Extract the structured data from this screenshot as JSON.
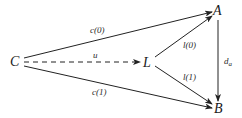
{
  "diagram": {
    "nodes": {
      "C": {
        "label": "C"
      },
      "L": {
        "label": "L"
      },
      "A": {
        "label": "A"
      },
      "B": {
        "label": "B"
      }
    },
    "edges": [
      {
        "from": "C",
        "to": "A",
        "label": "c(0)",
        "style": "solid"
      },
      {
        "from": "C",
        "to": "L",
        "label": "u",
        "style": "dashed"
      },
      {
        "from": "C",
        "to": "B",
        "label": "c(1)",
        "style": "solid"
      },
      {
        "from": "L",
        "to": "A",
        "label": "l(0)",
        "style": "solid"
      },
      {
        "from": "L",
        "to": "B",
        "label": "l(1)",
        "style": "solid"
      },
      {
        "from": "A",
        "to": "B",
        "label_main": "d",
        "label_sub": "a",
        "style": "solid"
      }
    ],
    "colors": {
      "line": "#222222",
      "background": "#ffffff"
    }
  }
}
